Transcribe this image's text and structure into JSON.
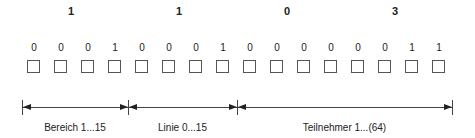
{
  "hex_digits": [
    "1",
    "1",
    "0",
    "3"
  ],
  "bits": [
    "0",
    "0",
    "0",
    "1",
    "0",
    "0",
    "0",
    "1",
    "0",
    "0",
    "0",
    "0",
    "0",
    "0",
    "1",
    "1"
  ],
  "segments": [
    {
      "label": "Bereich 1...15"
    },
    {
      "label": "Linie 0...15"
    },
    {
      "label": "Teilnehmer 1...(64)"
    }
  ]
}
